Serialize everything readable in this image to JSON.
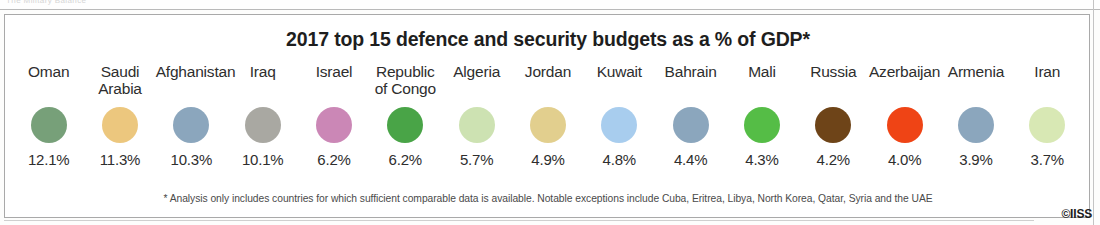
{
  "scan": {
    "top_ghost_text": "The Military Balance",
    "credit": "©IISS"
  },
  "figure": {
    "title": "2017 top 15 defence and security budgets as a % of GDP*",
    "footnote": "* Analysis only includes countries for which sufficient comparable data is available. Notable exceptions include Cuba, Eritrea, Libya, North Korea, Qatar, Syria and the UAE"
  },
  "chart_data": {
    "type": "bar",
    "title": "2017 top 15 defence and security budgets as a % of GDP*",
    "xlabel": "",
    "ylabel": "Defence and security budget (% of GDP)",
    "grid": false,
    "legend": "none",
    "note": "Each country is shown as a uniformly sized coloured circle with its value printed below; circle area is not scaled to the value.",
    "categories": [
      "Oman",
      "Saudi Arabia",
      "Afghanistan",
      "Iraq",
      "Israel",
      "Republic of Congo",
      "Algeria",
      "Jordan",
      "Kuwait",
      "Bahrain",
      "Mali",
      "Russia",
      "Azerbaijan",
      "Armenia",
      "Iran"
    ],
    "values": [
      12.1,
      11.3,
      10.3,
      10.1,
      6.2,
      6.2,
      5.7,
      4.9,
      4.8,
      4.4,
      4.3,
      4.2,
      4.0,
      3.9,
      3.7
    ],
    "value_labels": [
      "12.1%",
      "11.3%",
      "10.3%",
      "10.1%",
      "6.2%",
      "6.2%",
      "5.7%",
      "4.9%",
      "4.8%",
      "4.4%",
      "4.3%",
      "4.2%",
      "4.0%",
      "3.9%",
      "3.7%"
    ],
    "colors": [
      "#77a079",
      "#ecc77e",
      "#8ba6bd",
      "#a9a8a2",
      "#cb87b6",
      "#49a447",
      "#cde2b2",
      "#e2cf8e",
      "#a8cdee",
      "#8ba6bd",
      "#55bd46",
      "#6e4418",
      "#ef4415",
      "#8ba6bd",
      "#d8e8b4"
    ],
    "ylim": [
      0,
      12.5
    ]
  },
  "countries": [
    {
      "label": "Oman",
      "label_lines": "Oman",
      "value": "12.1%",
      "color": "#77a079"
    },
    {
      "label": "Saudi Arabia",
      "label_lines": "Saudi\nArabia",
      "value": "11.3%",
      "color": "#ecc77e"
    },
    {
      "label": "Afghanistan",
      "label_lines": "Afghanistan",
      "value": "10.3%",
      "color": "#8ba6bd"
    },
    {
      "label": "Iraq",
      "label_lines": "Iraq",
      "value": "10.1%",
      "color": "#a9a8a2"
    },
    {
      "label": "Israel",
      "label_lines": "Israel",
      "value": "6.2%",
      "color": "#cb87b6"
    },
    {
      "label": "Republic of Congo",
      "label_lines": "Republic\nof Congo",
      "value": "6.2%",
      "color": "#49a447"
    },
    {
      "label": "Algeria",
      "label_lines": "Algeria",
      "value": "5.7%",
      "color": "#cde2b2"
    },
    {
      "label": "Jordan",
      "label_lines": "Jordan",
      "value": "4.9%",
      "color": "#e2cf8e"
    },
    {
      "label": "Kuwait",
      "label_lines": "Kuwait",
      "value": "4.8%",
      "color": "#a8cdee"
    },
    {
      "label": "Bahrain",
      "label_lines": "Bahrain",
      "value": "4.4%",
      "color": "#8ba6bd"
    },
    {
      "label": "Mali",
      "label_lines": "Mali",
      "value": "4.3%",
      "color": "#55bd46"
    },
    {
      "label": "Russia",
      "label_lines": "Russia",
      "value": "4.2%",
      "color": "#6e4418"
    },
    {
      "label": "Azerbaijan",
      "label_lines": "Azerbaijan",
      "value": "4.0%",
      "color": "#ef4415"
    },
    {
      "label": "Armenia",
      "label_lines": "Armenia",
      "value": "3.9%",
      "color": "#8ba6bd"
    },
    {
      "label": "Iran",
      "label_lines": "Iran",
      "value": "3.7%",
      "color": "#d8e8b4"
    }
  ]
}
